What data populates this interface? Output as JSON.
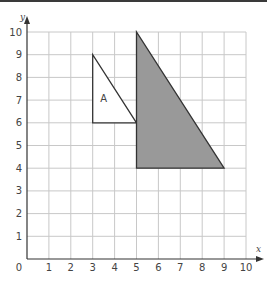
{
  "chart_data": {
    "type": "diagram",
    "title": "",
    "xlabel": "x",
    "ylabel": "y",
    "xlim": [
      0,
      10
    ],
    "ylim": [
      0,
      10
    ],
    "grid": true,
    "x_ticks": [
      "0",
      "1",
      "2",
      "3",
      "4",
      "5",
      "6",
      "7",
      "8",
      "9",
      "10"
    ],
    "y_ticks": [
      "1",
      "2",
      "3",
      "4",
      "5",
      "6",
      "7",
      "8",
      "9",
      "10"
    ],
    "shapes": [
      {
        "name": "A",
        "label": "A",
        "fill": "#ffffff",
        "stroke": "#333333",
        "points": [
          [
            3,
            9
          ],
          [
            3,
            6
          ],
          [
            5,
            6
          ]
        ],
        "label_pos": [
          3.5,
          6.9
        ]
      },
      {
        "name": "image",
        "label": "",
        "fill": "#999999",
        "stroke": "#333333",
        "points": [
          [
            5,
            10
          ],
          [
            5,
            4
          ],
          [
            9,
            4
          ]
        ]
      }
    ]
  },
  "colors": {
    "grid": "#c8c8c8",
    "axis": "#333333",
    "shaded": "#999999"
  }
}
